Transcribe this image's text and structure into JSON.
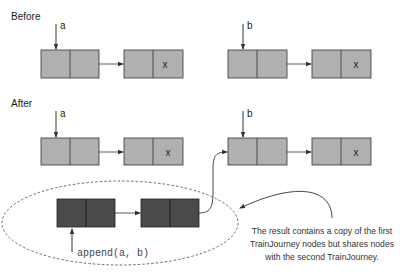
{
  "sections": {
    "before": {
      "title": "Before"
    },
    "after": {
      "title": "After"
    }
  },
  "pointers": {
    "before_a": "a",
    "before_b": "b",
    "after_a": "a",
    "after_b": "b",
    "append_call": "append(a, b)"
  },
  "nodes": {
    "tail_marker": "x"
  },
  "annotation": {
    "lines": [
      "The result contains a copy of the first",
      "TrainJourney nodes but shares nodes",
      "with the second TrainJourney."
    ]
  },
  "colors": {
    "node_fill": "#b0b0b0",
    "copied_node_fill": "#4a4a4a",
    "stroke": "#333333",
    "background": "#ffffff"
  }
}
